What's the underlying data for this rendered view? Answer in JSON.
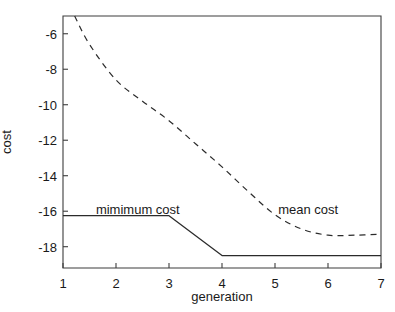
{
  "chart_data": {
    "type": "line",
    "title": "",
    "xlabel": "generation",
    "ylabel": "cost",
    "xlim": [
      1,
      7
    ],
    "ylim": [
      -19.2,
      -5.0
    ],
    "xticks": [
      1,
      2,
      3,
      4,
      5,
      6,
      7
    ],
    "xticklabels": [
      "1",
      "2",
      "3",
      "4",
      "5",
      "6",
      "7"
    ],
    "yticks": [
      -6,
      -8,
      -10,
      -12,
      -14,
      -16,
      -18
    ],
    "yticklabels": [
      "-6",
      "-8",
      "-10",
      "-12",
      "-14",
      "-16",
      "-18"
    ],
    "grid": false,
    "legend_position": "inline-annotations",
    "series": [
      {
        "name": "mimimum cost",
        "style": "solid",
        "color": "#2b2b2b",
        "x": [
          1,
          2,
          3,
          4,
          5,
          6,
          7
        ],
        "values": [
          -16.25,
          -16.25,
          -16.25,
          -18.5,
          -18.5,
          -18.5,
          -18.5
        ]
      },
      {
        "name": "mean cost",
        "style": "dashed",
        "color": "#2b2b2b",
        "x": [
          1.22,
          1.5,
          2,
          2.5,
          3,
          3.5,
          4,
          4.5,
          5,
          5.5,
          6,
          6.5,
          7
        ],
        "values": [
          -5.0,
          -6.6,
          -8.6,
          -9.8,
          -10.9,
          -12.2,
          -13.5,
          -14.9,
          -16.2,
          -17.0,
          -17.35,
          -17.35,
          -17.3
        ]
      }
    ],
    "annotations": [
      {
        "text": "mimimum cost",
        "x": 1.62,
        "y": -15.95
      },
      {
        "text": "mean cost",
        "x": 5.06,
        "y": -15.95
      }
    ]
  }
}
